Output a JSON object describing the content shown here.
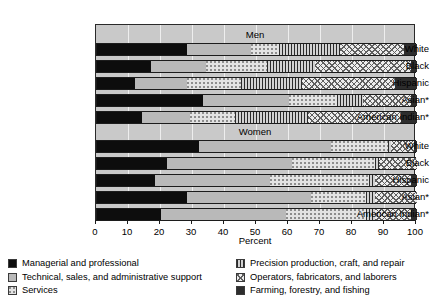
{
  "chart_data": {
    "type": "bar",
    "orientation": "horizontal",
    "stacked": true,
    "title": "",
    "xlabel": "Percent",
    "ylabel": "",
    "xlim": [
      0,
      100
    ],
    "xticks": [
      0,
      10,
      20,
      30,
      40,
      50,
      60,
      70,
      80,
      90,
      100
    ],
    "grid": true,
    "legend_position": "bottom",
    "panels": [
      {
        "label": "Men",
        "categories": [
          "White",
          "Black",
          "Hispanic",
          "Asian*",
          "American Indian*"
        ],
        "series": [
          {
            "name": "Managerial and professional",
            "values": [
              28,
              17,
              12,
              33,
              14
            ]
          },
          {
            "name": "Technical, sales, and administrative support",
            "values": [
              20,
              17,
              16,
              27,
              15
            ]
          },
          {
            "name": "Services",
            "values": [
              9,
              19,
              17,
              15,
              14
            ]
          },
          {
            "name": "Precision production, craft, and repair",
            "values": [
              19,
              15,
              19,
              8,
              23
            ]
          },
          {
            "name": "Operators, fabricators, and laborers",
            "values": [
              20,
              30,
              29,
              15,
              29
            ]
          },
          {
            "name": "Farming, forestry, and fishing",
            "values": [
              4,
              2,
              7,
              2,
              5
            ]
          }
        ]
      },
      {
        "label": "Women",
        "categories": [
          "White",
          "Black",
          "Hispanic",
          "Asian*",
          "American Indian*"
        ],
        "series": [
          {
            "name": "Managerial and professional",
            "values": [
              32,
              22,
              18,
              28,
              20
            ]
          },
          {
            "name": "Technical, sales, and administrative support",
            "values": [
              41,
              39,
              36,
              39,
              39
            ]
          },
          {
            "name": "Services",
            "values": [
              18,
              26,
              31,
              17,
              25
            ]
          },
          {
            "name": "Precision production, craft, and repair",
            "values": [
              1,
              1,
              2,
              3,
              3
            ]
          },
          {
            "name": "Operators, fabricators, and laborers",
            "values": [
              7,
              12,
              11,
              13,
              11
            ]
          },
          {
            "name": "Farming, forestry, and fishing",
            "values": [
              1,
              0,
              2,
              0,
              2
            ]
          }
        ]
      }
    ],
    "legend": [
      {
        "key": "managerial",
        "label": "Managerial and professional",
        "pattern": "solid-black",
        "color": "#0d0d0d"
      },
      {
        "key": "technical",
        "label": "Technical, sales, and administrative support",
        "pattern": "solid-light-gray",
        "color": "#b9b9b9"
      },
      {
        "key": "services",
        "label": "Services",
        "pattern": "dotted",
        "color": "#e3e3e3"
      },
      {
        "key": "precision",
        "label": "Precision production, craft, and repair",
        "pattern": "vertical-lines",
        "color": "#d2d2d2"
      },
      {
        "key": "operators",
        "label": "Operators, fabricators, and laborers",
        "pattern": "crosshatch",
        "color": "#ededed"
      },
      {
        "key": "farming",
        "label": "Farming, forestry, and fishing",
        "pattern": "solid-dark-gray",
        "color": "#2d2d2d"
      }
    ]
  }
}
